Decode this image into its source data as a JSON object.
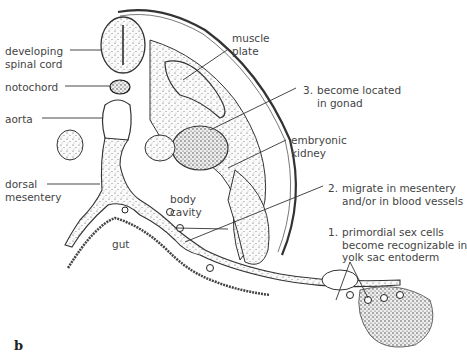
{
  "figure": {
    "panel_label": "b",
    "labels": {
      "developing_spinal_cord": [
        "developing",
        "spinal cord"
      ],
      "notochord": "notochord",
      "aorta": "aorta",
      "dorsal_mesentery": [
        "dorsal",
        "mesentery"
      ],
      "muscle_plate": [
        "muscle",
        "plate"
      ],
      "embryonic_kidney": [
        "embryonic",
        "kidney"
      ],
      "body_cavity": [
        "body",
        "cavity"
      ],
      "gut": "gut"
    },
    "steps": [
      {
        "number": "1.",
        "lines": [
          "primordial sex cells",
          "become recognizable in",
          "yolk sac entoderm"
        ]
      },
      {
        "number": "2.",
        "lines": [
          "migrate in mesentery",
          "and/or in blood vessels"
        ]
      },
      {
        "number": "3.",
        "lines": [
          "become located",
          "in gonad"
        ]
      }
    ]
  }
}
